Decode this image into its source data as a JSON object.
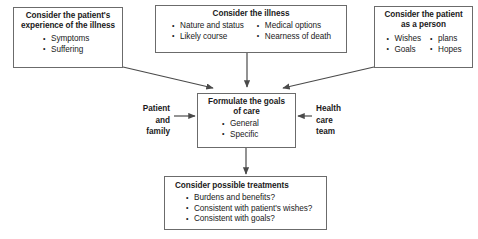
{
  "diagram": {
    "line_color": "#6b6b6b",
    "text_color": "#1a1a1a",
    "background": "#ffffff"
  },
  "boxes": {
    "experience": {
      "title_line1": "Consider the patient's",
      "title_line2": "experience of the illness",
      "bullets": [
        "Symptoms",
        "Suffering"
      ]
    },
    "illness": {
      "title": "Consider the illness",
      "bullets_left": [
        "Nature and status",
        "Likely course"
      ],
      "bullets_right": [
        "Medical options",
        "Nearness of death"
      ]
    },
    "person": {
      "title_line1": "Consider the patient",
      "title_line2": "as a person",
      "bullets_left": [
        "Wishes",
        "Goals"
      ],
      "bullets_right": [
        "plans",
        "Hopes"
      ]
    },
    "goals": {
      "title_line1": "Formulate the goals",
      "title_line2": "of care",
      "bullets": [
        "General",
        "Specific"
      ]
    },
    "treatments": {
      "title": "Consider possible treatments",
      "bullets": [
        "Burdens and benefits?",
        "Consistent with patient's wishes?",
        "Consistent with goals?"
      ]
    }
  },
  "side_labels": {
    "left": {
      "line1": "Patient",
      "line2": "and",
      "line3": "family"
    },
    "right": {
      "line1": "Health",
      "line2": "care",
      "line3": "team"
    }
  }
}
